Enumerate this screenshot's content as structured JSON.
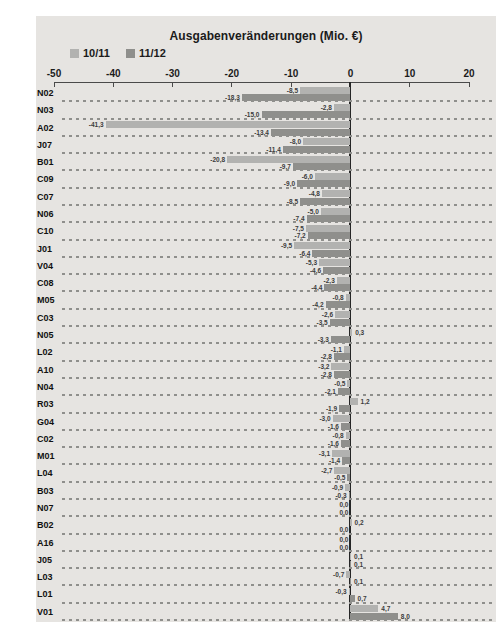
{
  "title": "Ausgabenveränderungen (Mio. €)",
  "legend": [
    {
      "label": "10/11",
      "color": "#b2b2b0"
    },
    {
      "label": "11/12",
      "color": "#8f8f8c"
    }
  ],
  "axis": {
    "ticks": [
      {
        "label": "-50",
        "value": -50
      },
      {
        "label": "-40",
        "value": -40
      },
      {
        "label": "-30",
        "value": -30
      },
      {
        "label": "-20",
        "value": -20
      },
      {
        "label": "-10",
        "value": -10
      },
      {
        "label": "0",
        "value": 0
      },
      {
        "label": "10",
        "value": 10
      },
      {
        "label": "20",
        "value": 20
      }
    ]
  },
  "chart_data": {
    "type": "bar",
    "orientation": "horizontal",
    "title": "Ausgabenveränderungen (Mio. €)",
    "xlim": [
      -50,
      20
    ],
    "grid": "dashed-row-separators",
    "legend_position": "top-left",
    "decimal_separator": ",",
    "categories": [
      "N02",
      "N03",
      "A02",
      "J07",
      "B01",
      "C09",
      "C07",
      "N06",
      "C10",
      "J01",
      "V04",
      "C08",
      "M05",
      "C03",
      "N05",
      "L02",
      "A10",
      "N04",
      "R03",
      "G04",
      "C02",
      "M01",
      "L04",
      "B03",
      "N07",
      "B02",
      "A16",
      "J05",
      "L03",
      "L01",
      "V01"
    ],
    "series": [
      {
        "name": "10/11",
        "values": [
          -8.5,
          -2.8,
          -41.3,
          -8.0,
          -20.8,
          -6.0,
          -4.8,
          -5.0,
          -7.5,
          -9.5,
          -5.3,
          -2.3,
          -0.8,
          -2.6,
          0.3,
          -1.1,
          -3.2,
          -0.5,
          1.2,
          -3.0,
          -0.8,
          -3.1,
          -2.7,
          -0.9,
          0.0,
          0.2,
          0.0,
          0.1,
          -0.7,
          -0.3,
          4.7
        ]
      },
      {
        "name": "11/12",
        "values": [
          -18.3,
          -15.0,
          -13.4,
          -11.4,
          -9.7,
          -9.0,
          -8.5,
          -7.4,
          -7.2,
          -6.4,
          -4.6,
          -4.4,
          -4.2,
          -3.5,
          -3.3,
          -2.8,
          -2.8,
          -2.1,
          -1.9,
          -1.6,
          -1.6,
          -1.4,
          -0.5,
          -0.3,
          0.0,
          0.0,
          0.0,
          0.1,
          0.1,
          0.7,
          8.0
        ]
      }
    ]
  },
  "colors": {
    "panel_background": "#e6e4e1",
    "bar_series_1": "#b2b2b0",
    "bar_series_2": "#8f8f8c",
    "axis_line": "#4a4a4a",
    "zero_line": "#262626",
    "separator_dash": "#8f8f8c",
    "text": "#1b1b1b"
  }
}
